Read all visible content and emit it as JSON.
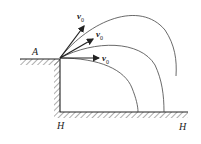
{
  "diagram": {
    "labels": {
      "point_a": "A",
      "h_left": "H",
      "h_right": "H"
    },
    "velocity_labels": [
      {
        "base": "v",
        "sub": "0"
      },
      {
        "base": "v",
        "sub": "0"
      },
      {
        "base": "v",
        "sub": "0"
      }
    ],
    "colors": {
      "stroke": "#222222",
      "curve": "#444444",
      "background": "#ffffff"
    }
  }
}
